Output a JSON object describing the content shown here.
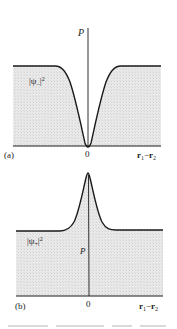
{
  "panels": [
    {
      "id": "a",
      "panel_label": "(a)",
      "y_axis_label": "P",
      "curve_label": "|ψ₋|²",
      "curve_label_base": "|ψ",
      "curve_label_sub": "−",
      "curve_label_sup": "2",
      "origin_label": "0",
      "x_axis_label_r1": "r",
      "x_axis_label_sub1": "1",
      "x_axis_label_minus": "−",
      "x_axis_label_r2": "r",
      "x_axis_label_sub2": "2",
      "shape": "dip to zero at origin, constant plateau elsewhere"
    },
    {
      "id": "b",
      "panel_label": "(b)",
      "y_axis_label": "P",
      "curve_label": "|ψ₊|²",
      "curve_label_base": "|ψ",
      "curve_label_sub": "+",
      "curve_label_sup": "2",
      "origin_label": "0",
      "x_axis_label_r1": "r",
      "x_axis_label_sub1": "1",
      "x_axis_label_minus": "−",
      "x_axis_label_r2": "r",
      "x_axis_label_sub2": "2",
      "shape": "peak at origin, constant plateau elsewhere"
    }
  ],
  "colors": {
    "fill": "#e6e6e6",
    "line": "#1a1a1a",
    "background": "#ffffff"
  }
}
